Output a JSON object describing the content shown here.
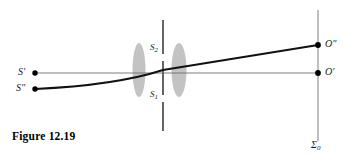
{
  "figure": {
    "caption": "Figure 12.19",
    "background_color": "#ffffff"
  },
  "labels": {
    "source_upper": "S′",
    "source_lower": "S″",
    "image_upper": "O″",
    "image_lower": "O′",
    "slit_upper": "S",
    "slit_upper_sub": "2",
    "slit_lower": "S",
    "slit_lower_sub": "1",
    "plane": "Σ",
    "plane_sub": "0"
  },
  "colors": {
    "ray_thick": "#111111",
    "ray_thin": "#6e6e6e",
    "lens_fill": "#b8b8b8",
    "dashed_line": "#4a4a4a",
    "plane_line": "#7a7a7a",
    "point_marker": "#000000",
    "caption_text": "#000000"
  },
  "geometry": {
    "source_upper_point": {
      "x": 35,
      "y": 73
    },
    "source_lower_point": {
      "x": 35,
      "y": 89
    },
    "image_upper_point": {
      "x": 318,
      "y": 45
    },
    "image_lower_point": {
      "x": 318,
      "y": 73
    },
    "lens_one": {
      "cx": 139,
      "cy": 70,
      "rx": 6.5,
      "ry": 27
    },
    "lens_two": {
      "cx": 179,
      "cy": 70,
      "rx": 7.5,
      "ry": 27
    },
    "dashed_line_x": 163,
    "dashed_line_top": 20,
    "dashed_line_bottom": 131,
    "plane_line_x": 318,
    "plane_line_top": 10,
    "plane_line_bottom": 141,
    "thin_ray": "M35,73 L318,73",
    "thick_ray": "M35,89 C95,86 130,80 163,70 L318,45"
  }
}
